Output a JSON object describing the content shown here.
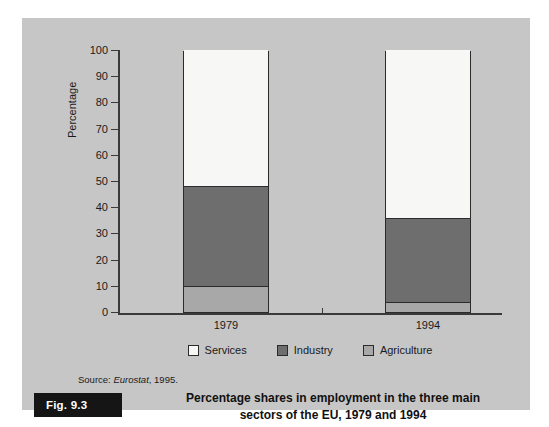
{
  "figure": {
    "tag": "Fig. 9.3",
    "caption_line1": "Percentage shares in employment in the three main",
    "caption_line2": "sectors of the EU, 1979 and 1994",
    "source_prefix": "Source:",
    "source_name": "Eurostat",
    "source_suffix": ", 1995."
  },
  "colors": {
    "panel_background": "#c6c6c6",
    "services": "#f7f7f5",
    "industry": "#6e6e6e",
    "agriculture": "#a8a8a8",
    "axis": "#3a3a3a",
    "outline": "#2b2b2b",
    "fig_tag_background": "#151515"
  },
  "chart_data": {
    "type": "bar",
    "subtype": "stacked",
    "title": "Percentage shares in employment in the three main sectors of the EU, 1979 and 1994",
    "xlabel": "",
    "ylabel": "Percentage",
    "categories": [
      "1979",
      "1994"
    ],
    "ylim": [
      0,
      100
    ],
    "yticks": [
      0,
      10,
      20,
      30,
      40,
      50,
      60,
      70,
      80,
      90,
      100
    ],
    "ytick_labels": [
      "0",
      "10",
      "20",
      "30",
      "40",
      "50",
      "60",
      "70",
      "80",
      "90",
      "100"
    ],
    "grid": false,
    "legend_position": "bottom-center",
    "stack_order_bottom_to_top": [
      "Agriculture",
      "Industry",
      "Services"
    ],
    "series": [
      {
        "name": "Services",
        "values": [
          52,
          64
        ],
        "color": "#f7f7f5"
      },
      {
        "name": "Industry",
        "values": [
          38,
          32
        ],
        "color": "#6e6e6e"
      },
      {
        "name": "Agriculture",
        "values": [
          10,
          4
        ],
        "color": "#a8a8a8"
      }
    ],
    "cumulative_tops": {
      "1979": {
        "Agriculture": 10,
        "Industry": 48,
        "Services": 100
      },
      "1994": {
        "Agriculture": 4,
        "Industry": 36,
        "Services": 100
      }
    },
    "annotations": []
  },
  "legend": {
    "items": [
      {
        "label": "Services",
        "swatch": "#f7f7f5"
      },
      {
        "label": "Industry",
        "swatch": "#6e6e6e"
      },
      {
        "label": "Agriculture",
        "swatch": "#a8a8a8"
      }
    ]
  }
}
